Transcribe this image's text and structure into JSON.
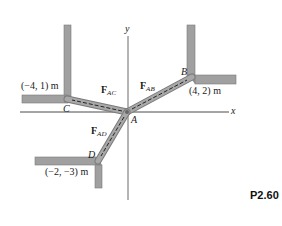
{
  "figure_id": "P2.60",
  "axes": {
    "x_label": "x",
    "y_label": "y"
  },
  "points": {
    "A": {
      "label": "A"
    },
    "B": {
      "label": "B",
      "coord": "(4, 2) m"
    },
    "C": {
      "label": "C",
      "coord": "(−4, 1) m"
    },
    "D": {
      "label": "D",
      "coord": "(−2, −3) m"
    }
  },
  "forces": {
    "AB": {
      "main": "F",
      "sub": "AB"
    },
    "AC": {
      "main": "F",
      "sub": "AC"
    },
    "AD": {
      "main": "F",
      "sub": "AD"
    }
  },
  "colors": {
    "bar_fill": "#9a9a9a",
    "bar_edge": "#6e6e6e",
    "axis": "#555555",
    "dash": "#222222"
  }
}
